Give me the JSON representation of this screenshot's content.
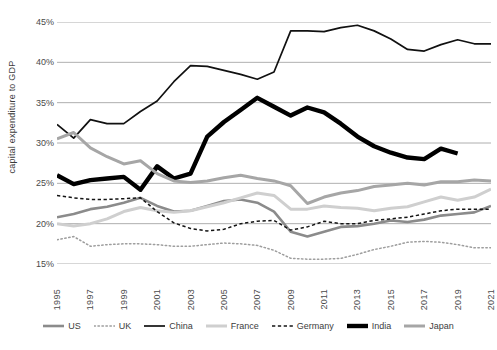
{
  "chart_data": {
    "type": "line",
    "title": "",
    "xlabel": "",
    "ylabel": "capital expenditure to GDP",
    "xlim": [
      1995,
      2021
    ],
    "ylim": [
      15,
      45
    ],
    "ytick_values": [
      15,
      20,
      25,
      30,
      35,
      40,
      45
    ],
    "ytick_labels": [
      "15%",
      "20%",
      "25%",
      "30%",
      "35%",
      "40%",
      "45%"
    ],
    "x": [
      1995,
      1996,
      1997,
      1998,
      1999,
      2000,
      2001,
      2002,
      2003,
      2004,
      2005,
      2006,
      2007,
      2008,
      2009,
      2010,
      2011,
      2012,
      2013,
      2014,
      2015,
      2016,
      2017,
      2018,
      2019,
      2020,
      2021
    ],
    "xtick_labels": [
      "1995",
      "1997",
      "1999",
      "2001",
      "2003",
      "2005",
      "2007",
      "2009",
      "2011",
      "2013",
      "2015",
      "2017",
      "2019",
      "2021"
    ],
    "xtick_values": [
      1995,
      1997,
      1999,
      2001,
      2003,
      2005,
      2007,
      2009,
      2011,
      2013,
      2015,
      2017,
      2019,
      2021
    ],
    "grid": "horizontal",
    "legend_position": "bottom",
    "series": [
      {
        "name": "US",
        "color": "#8b8b8b",
        "style": "solid",
        "width": 2.6,
        "values": [
          20.8,
          21.2,
          21.8,
          22.1,
          22.6,
          23.2,
          22.2,
          21.5,
          21.6,
          22.2,
          22.8,
          23.0,
          22.6,
          21.5,
          19.0,
          18.4,
          19.0,
          19.6,
          19.7,
          20.0,
          20.4,
          20.2,
          20.5,
          21.0,
          21.2,
          21.4,
          22.2
        ]
      },
      {
        "name": "UK",
        "color": "#9e9e9e",
        "style": "dotted",
        "width": 1.5,
        "values": [
          18.0,
          18.4,
          17.2,
          17.4,
          17.5,
          17.5,
          17.4,
          17.2,
          17.2,
          17.4,
          17.6,
          17.5,
          17.3,
          16.7,
          15.7,
          15.6,
          15.6,
          15.7,
          16.2,
          16.8,
          17.2,
          17.7,
          17.8,
          17.7,
          17.4,
          17.0,
          17.0
        ]
      },
      {
        "name": "China",
        "color": "#111111",
        "style": "solid",
        "width": 1.7,
        "values": [
          32.3,
          30.6,
          32.9,
          32.4,
          32.4,
          33.9,
          35.2,
          37.6,
          39.6,
          39.5,
          39.0,
          38.5,
          37.9,
          38.8,
          43.9,
          43.9,
          43.8,
          44.3,
          44.6,
          43.9,
          42.9,
          41.6,
          41.4,
          42.2,
          42.8,
          42.3,
          42.3
        ]
      },
      {
        "name": "France",
        "color": "#cfcfcf",
        "style": "solid",
        "width": 3.0,
        "values": [
          20.0,
          19.7,
          20.0,
          20.6,
          21.5,
          22.0,
          21.6,
          21.4,
          21.6,
          22.1,
          22.6,
          23.2,
          23.8,
          23.5,
          21.8,
          21.8,
          22.2,
          22.0,
          21.9,
          21.6,
          21.9,
          22.1,
          22.7,
          23.3,
          22.9,
          23.3,
          24.3
        ]
      },
      {
        "name": "Germany",
        "color": "#141414",
        "style": "dashed",
        "width": 1.5,
        "values": [
          23.5,
          23.2,
          23.0,
          23.0,
          23.1,
          23.2,
          21.5,
          20.1,
          19.4,
          19.1,
          19.3,
          20.0,
          20.3,
          20.4,
          19.2,
          19.6,
          20.3,
          20.0,
          20.0,
          20.4,
          20.6,
          20.8,
          21.2,
          21.6,
          21.8,
          21.8,
          21.8
        ]
      },
      {
        "name": "India",
        "color": "#000000",
        "style": "solid",
        "width": 4.4,
        "values": [
          26.0,
          24.9,
          25.4,
          25.6,
          25.8,
          24.2,
          27.1,
          25.6,
          26.2,
          30.8,
          32.6,
          34.1,
          35.6,
          34.5,
          33.4,
          34.4,
          33.8,
          32.4,
          30.8,
          29.6,
          28.8,
          28.2,
          28.0,
          29.3,
          28.7,
          null,
          null
        ]
      },
      {
        "name": "Japan",
        "color": "#a6a6a6",
        "style": "solid",
        "width": 3.0,
        "values": [
          30.5,
          31.3,
          29.4,
          28.3,
          27.4,
          27.8,
          26.2,
          25.3,
          25.1,
          25.3,
          25.7,
          26.0,
          25.6,
          25.3,
          24.7,
          22.5,
          23.3,
          23.8,
          24.1,
          24.6,
          24.8,
          25.0,
          24.8,
          25.2,
          25.2,
          25.4,
          25.3
        ]
      }
    ]
  },
  "axis": {
    "y_title": "capital expenditure to GDP"
  },
  "colors": {
    "grid": "#9a9a9a",
    "text": "#4a4a4a",
    "background": "#ffffff"
  }
}
